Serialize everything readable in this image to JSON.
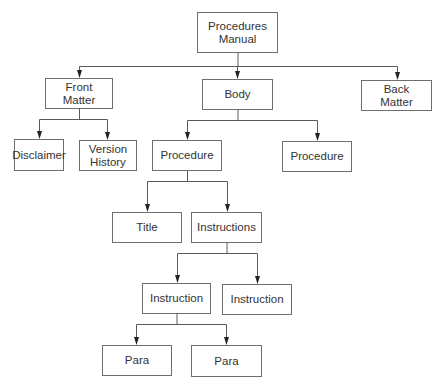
{
  "diagram": {
    "type": "tree",
    "title": "Procedures Manual",
    "colors": {
      "line": "#5a5a5a",
      "border": "#6e6e6e",
      "text": "#333333",
      "background": "#ffffff"
    },
    "nodes": [
      {
        "id": "root",
        "label": "Procedures\nManual",
        "x": 197,
        "y": 12,
        "w": 81,
        "h": 41
      },
      {
        "id": "front",
        "label": "Front\nMatter",
        "x": 45,
        "y": 78,
        "w": 68,
        "h": 31,
        "parent": "root"
      },
      {
        "id": "body",
        "label": "Body",
        "x": 202,
        "y": 79,
        "w": 71,
        "h": 31,
        "parent": "root"
      },
      {
        "id": "back",
        "label": "Back\nMatter",
        "x": 361,
        "y": 80,
        "w": 71,
        "h": 31,
        "parent": "root"
      },
      {
        "id": "disclaimer",
        "label": "Disclaimer",
        "x": 14,
        "y": 139,
        "w": 50,
        "h": 32,
        "parent": "front"
      },
      {
        "id": "version",
        "label": "Version\nHistory",
        "x": 79,
        "y": 140,
        "w": 58,
        "h": 31,
        "parent": "front"
      },
      {
        "id": "proc1",
        "label": "Procedure",
        "x": 152,
        "y": 140,
        "w": 70,
        "h": 31,
        "parent": "body"
      },
      {
        "id": "proc2",
        "label": "Procedure",
        "x": 282,
        "y": 141,
        "w": 70,
        "h": 31,
        "parent": "body"
      },
      {
        "id": "title",
        "label": "Title",
        "x": 112,
        "y": 212,
        "w": 70,
        "h": 31,
        "parent": "proc1"
      },
      {
        "id": "instructions",
        "label": "Instructions",
        "x": 191,
        "y": 212,
        "w": 71,
        "h": 31,
        "parent": "proc1"
      },
      {
        "id": "instr1",
        "label": "Instruction",
        "x": 142,
        "y": 283,
        "w": 69,
        "h": 31,
        "parent": "instructions"
      },
      {
        "id": "instr2",
        "label": "Instruction",
        "x": 222,
        "y": 284,
        "w": 70,
        "h": 31,
        "parent": "instructions"
      },
      {
        "id": "para1",
        "label": "Para",
        "x": 102,
        "y": 345,
        "w": 70,
        "h": 31,
        "parent": "instr1"
      },
      {
        "id": "para2",
        "label": "Para",
        "x": 191,
        "y": 345,
        "w": 71,
        "h": 32,
        "parent": "instr1"
      }
    ],
    "connectors": [
      {
        "from": "root",
        "busY": 66,
        "children": [
          {
            "x": 79,
            "top": 78
          },
          {
            "x": 237,
            "top": 79
          },
          {
            "x": 397,
            "top": 80
          }
        ]
      },
      {
        "from": "front",
        "busY": 119,
        "children": [
          {
            "x": 39,
            "top": 139
          },
          {
            "x": 107,
            "top": 140
          }
        ]
      },
      {
        "from": "body",
        "busY": 120,
        "children": [
          {
            "x": 187,
            "top": 140
          },
          {
            "x": 317,
            "top": 141
          }
        ]
      },
      {
        "from": "proc1",
        "busY": 181,
        "children": [
          {
            "x": 147,
            "top": 212
          },
          {
            "x": 227,
            "top": 212
          }
        ]
      },
      {
        "from": "instructions",
        "busY": 253,
        "children": [
          {
            "x": 177,
            "top": 283
          },
          {
            "x": 257,
            "top": 284
          }
        ]
      },
      {
        "from": "instr1",
        "busY": 324,
        "children": [
          {
            "x": 136,
            "top": 345
          },
          {
            "x": 226,
            "top": 345
          }
        ]
      }
    ]
  }
}
